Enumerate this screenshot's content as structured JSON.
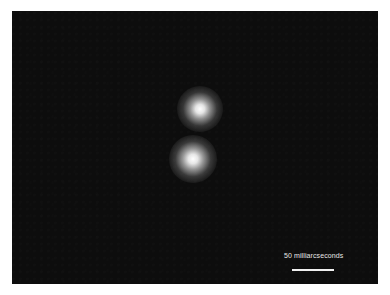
{
  "image": {
    "description": "Telescope image of a binary star system on a dark background",
    "background_color": "#0d0d0d",
    "border_color": "#ffffff"
  },
  "stars": [
    {
      "name": "star-upper",
      "center_px": [
        200,
        109
      ],
      "color": "#ffffff"
    },
    {
      "name": "star-lower",
      "center_px": [
        193,
        159
      ],
      "color": "#ffffff"
    }
  ],
  "scale": {
    "label": "50 milliarcseconds",
    "bar_color": "#f0f0f0"
  }
}
